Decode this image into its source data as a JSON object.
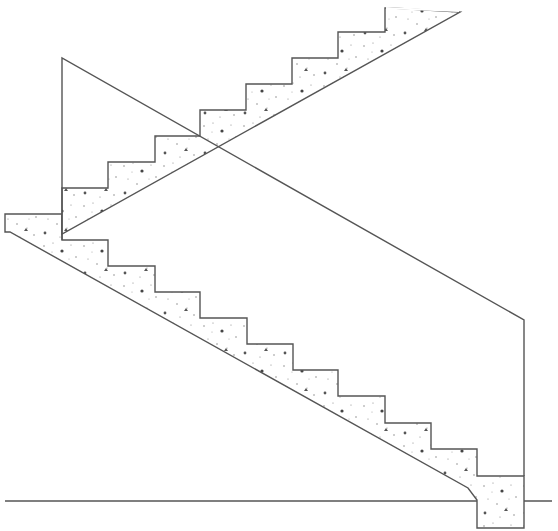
{
  "diagram": {
    "type": "technical-drawing",
    "colors": {
      "background": "#ffffff",
      "line": "#555555",
      "aggregate": "#444444"
    },
    "elements": {
      "lower_flight": {
        "material": "concrete (stippled)",
        "step_count": 10,
        "outline": "62,240 108,240 108,266 155,266 155,292 200,292 200,318 247,318 247,344 293,344 293,370 338,370 338,396 385,396 385,423 431,423 431,449 477,449 477,476 524,476 524,528 477,528 477,500 468,488 10,232 5,232 5,214 62,214"
      },
      "upper_flight": {
        "material": "concrete (stippled)",
        "step_count": 7,
        "outline": "62,234 62,188 108,188 108,162 155,162 155,136 200,136 200,110 246,110 246,84 292,84 292,58 338,58 338,32 385,32 385,8 392,8 460,12"
      },
      "wall_outline": {
        "points": "62,240 62,58 524,320 524,476"
      },
      "ground_line": {
        "x1": 5,
        "y1": 501,
        "x2": 552,
        "y2": 501
      }
    }
  }
}
